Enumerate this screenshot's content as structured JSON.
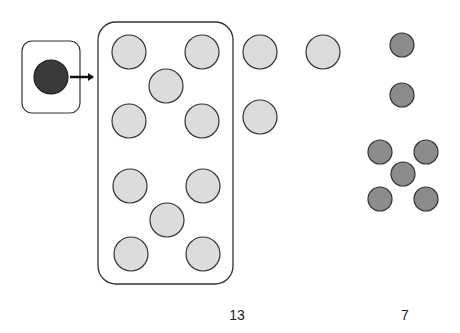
{
  "diagram": {
    "colors": {
      "dark_circle": "#3a3a3a",
      "light_circle": "#dcdcdc",
      "medium_circle": "#8c8c8c",
      "stroke": "#333333"
    },
    "source_box": {
      "x": 22,
      "y": 41,
      "w": 58,
      "h": 72,
      "rx": 10,
      "circle": {
        "cx": 51,
        "cy": 77,
        "r": 17
      }
    },
    "arrow": {
      "x1": 70,
      "y1": 77,
      "x2": 96,
      "y2": 77
    },
    "group_box": {
      "x": 98,
      "y": 22,
      "w": 135,
      "h": 262,
      "rx": 18
    },
    "group_circles": [
      {
        "cx": 129,
        "cy": 52
      },
      {
        "cx": 202,
        "cy": 52
      },
      {
        "cx": 166,
        "cy": 86
      },
      {
        "cx": 129,
        "cy": 121
      },
      {
        "cx": 202,
        "cy": 121
      },
      {
        "cx": 130,
        "cy": 186
      },
      {
        "cx": 203,
        "cy": 186
      },
      {
        "cx": 167,
        "cy": 220
      },
      {
        "cx": 131,
        "cy": 254
      },
      {
        "cx": 203,
        "cy": 254
      }
    ],
    "outside_circles": [
      {
        "cx": 260,
        "cy": 52
      },
      {
        "cx": 323,
        "cy": 52
      },
      {
        "cx": 260,
        "cy": 117
      }
    ],
    "large_r": 17,
    "small_circles": [
      {
        "cx": 402,
        "cy": 45
      },
      {
        "cx": 402,
        "cy": 95
      },
      {
        "cx": 380,
        "cy": 152
      },
      {
        "cx": 426,
        "cy": 152
      },
      {
        "cx": 403,
        "cy": 174
      },
      {
        "cx": 380,
        "cy": 199
      },
      {
        "cx": 426,
        "cy": 199
      }
    ],
    "small_r": 12
  },
  "labels": {
    "light_count": "13",
    "dark_count": "7"
  }
}
